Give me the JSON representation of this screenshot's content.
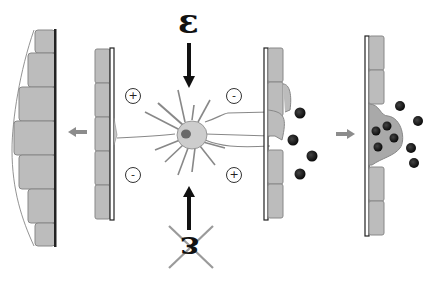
{
  "diagram": {
    "stimulus_label": "ε",
    "blocked_stimulus_label": "ε",
    "charge_symbols": {
      "top_left": "+",
      "top_right": "-",
      "bottom_left": "-",
      "bottom_right": "+"
    },
    "panels": [
      {
        "id": "left-result",
        "description": "Epithelial cell layer bulging outward (proliferation)"
      },
      {
        "id": "left-membrane",
        "description": "Basement membrane with cells; neuron process attached"
      },
      {
        "id": "neuron",
        "description": "Central neuron-like cell with dendrites and nucleus"
      },
      {
        "id": "right-membrane",
        "description": "Membrane with process and secreted granules"
      },
      {
        "id": "right-result",
        "description": "Cell extruding granules (secretion)"
      }
    ],
    "colors": {
      "cell_fill": "#b9b9b9",
      "cell_stroke": "#8a8a8a",
      "neuron_fill": "#c8c8c8",
      "nucleus": "#6a6a6a",
      "granule": "#1a1a1a",
      "arrow_gray": "#8c8c8c",
      "cross_gray": "#999999"
    }
  }
}
